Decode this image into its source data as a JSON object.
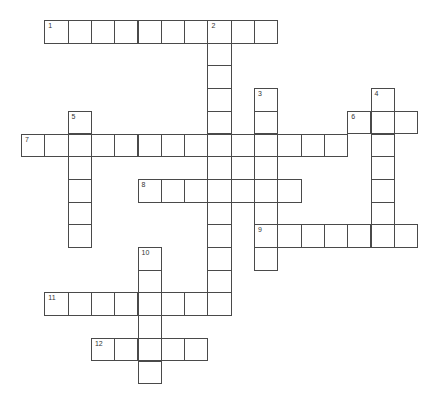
{
  "puzzle": {
    "type": "crossword",
    "origin": {
      "x": 21,
      "y": 20
    },
    "cell_w": 23.3,
    "cell_h": 22.7,
    "line_color": "#4a4a4a",
    "number_color": "#333333",
    "entries": [
      {
        "number": "1",
        "direction": "across",
        "row": 0,
        "col": 1,
        "length": 10
      },
      {
        "number": "2",
        "direction": "down",
        "row": 0,
        "col": 8,
        "length": 13
      },
      {
        "number": "3",
        "direction": "down",
        "row": 3,
        "col": 10,
        "length": 8
      },
      {
        "number": "4",
        "direction": "down",
        "row": 3,
        "col": 15,
        "length": 7
      },
      {
        "number": "5",
        "direction": "down",
        "row": 4,
        "col": 2,
        "length": 6
      },
      {
        "number": "6",
        "direction": "across",
        "row": 4,
        "col": 14,
        "length": 3
      },
      {
        "number": "7",
        "direction": "across",
        "row": 5,
        "col": 0,
        "length": 14
      },
      {
        "number": "8",
        "direction": "across",
        "row": 7,
        "col": 5,
        "length": 7
      },
      {
        "number": "9",
        "direction": "across",
        "row": 9,
        "col": 10,
        "length": 7
      },
      {
        "number": "10",
        "direction": "down",
        "row": 10,
        "col": 5,
        "length": 6
      },
      {
        "number": "11",
        "direction": "across",
        "row": 12,
        "col": 1,
        "length": 8
      },
      {
        "number": "12",
        "direction": "across",
        "row": 14,
        "col": 3,
        "length": 5
      }
    ]
  }
}
